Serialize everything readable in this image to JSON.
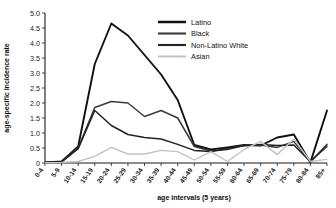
{
  "chart_data": {
    "type": "line",
    "title": "",
    "xlabel": "age intervals (5 years)",
    "ylabel": "age-specific incidence rate",
    "categories": [
      "0-4",
      "5-9",
      "10-14",
      "15-19",
      "20-24",
      "25-29",
      "30-34",
      "35-39",
      "40-44",
      "45-49",
      "50-54",
      "55-59",
      "60-64",
      "65-69",
      "70-74",
      "75-79",
      "80-84",
      "85+"
    ],
    "ylim": [
      0,
      5.0
    ],
    "ytick_labels": [
      "0",
      "0.5",
      "1.0",
      "1.5",
      "2.0",
      "2.5",
      "3.0",
      "3.5",
      "4.0",
      "4.5",
      "5.0"
    ],
    "ytick_values": [
      0,
      0.5,
      1.0,
      1.5,
      2.0,
      2.5,
      3.0,
      3.5,
      4.0,
      4.5,
      5.0
    ],
    "grid": false,
    "legend_position": "top-center",
    "series": [
      {
        "name": "Latino",
        "color": "#111111",
        "width": 1.9,
        "values": [
          0.02,
          0.05,
          0.55,
          3.3,
          4.65,
          4.25,
          3.6,
          2.95,
          2.1,
          0.6,
          0.45,
          0.52,
          0.6,
          0.58,
          0.85,
          0.95,
          0.02,
          1.75
        ]
      },
      {
        "name": "Black",
        "color": "#3a3a3a",
        "width": 1.5,
        "values": [
          0.02,
          0.04,
          0.5,
          1.85,
          2.05,
          2.0,
          1.55,
          1.75,
          1.5,
          0.55,
          0.4,
          0.45,
          0.58,
          0.6,
          0.52,
          0.72,
          0.05,
          0.55
        ]
      },
      {
        "name": "Non-Latino White",
        "color": "#222222",
        "width": 1.5,
        "values": [
          0.02,
          0.04,
          0.48,
          1.75,
          1.25,
          0.95,
          0.85,
          0.8,
          0.62,
          0.42,
          0.38,
          0.48,
          0.58,
          0.62,
          0.58,
          0.6,
          0.04,
          0.62
        ]
      },
      {
        "name": "Asian",
        "color": "#c2c2c2",
        "width": 1.4,
        "values": [
          0.01,
          0.02,
          0.05,
          0.22,
          0.52,
          0.3,
          0.3,
          0.42,
          0.38,
          0.1,
          0.38,
          0.05,
          0.45,
          0.72,
          0.28,
          0.8,
          0.05,
          0.12
        ]
      }
    ]
  },
  "legend": {
    "items": [
      {
        "label": "Latino"
      },
      {
        "label": "Black"
      },
      {
        "label": "Non-Latino White"
      },
      {
        "label": "Asian"
      }
    ]
  }
}
